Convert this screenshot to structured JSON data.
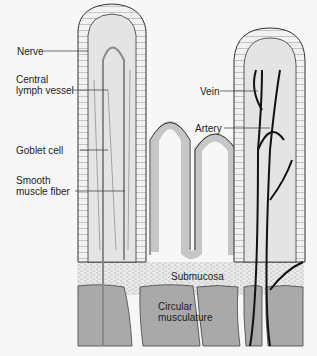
{
  "figure": {
    "labels": {
      "nerve": "Nerve",
      "central_lymph_vessel_1": "Central",
      "central_lymph_vessel_2": "lymph vessel",
      "goblet_cell": "Goblet cell",
      "smooth_muscle_fiber_1": "Smooth",
      "smooth_muscle_fiber_2": "muscle fiber",
      "vein": "Vein",
      "artery": "Artery",
      "submucosa": "Submucosa",
      "circular_musculature_1": "Circular",
      "circular_musculature_2": "musculature"
    },
    "colors": {
      "background": "#f7f7f7",
      "tissue_fill": "#e4e4e4",
      "muscle_fill": "#a9a9a9",
      "vessel_dark": "#111111",
      "lymph_gray": "#8a8a8a",
      "outline": "#333333"
    }
  }
}
